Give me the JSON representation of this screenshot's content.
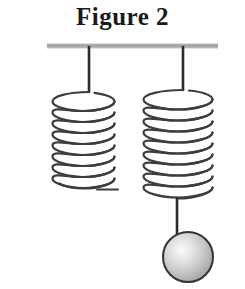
{
  "figure": {
    "title": "Figure 2",
    "caption_position": "top-center",
    "background_color": "#ffffff",
    "width": 245,
    "height": 289
  },
  "ceiling": {
    "name": "support-bar",
    "label": "ceiling support bar",
    "color": "#a8a8a8",
    "x1": 47,
    "x2": 218,
    "y": 46,
    "thickness": 5
  },
  "springs": [
    {
      "id": "left",
      "name": "spring-left",
      "label": "Left spring (no mass attached)",
      "hanger_x": 89,
      "hanger_top": 48,
      "hanger_bottom": 92,
      "coil_left": 52,
      "coil_right": 115,
      "coil_top": 88,
      "coil_bottom": 190,
      "turns": 9,
      "wire_color": "#3d3d3d",
      "wire_width": 2.2,
      "has_mass": false,
      "free_end": true
    },
    {
      "id": "right",
      "name": "spring-right",
      "label": "Right spring (mass attached)",
      "hanger_x": 183,
      "hanger_top": 48,
      "hanger_bottom": 90,
      "coil_left": 143,
      "coil_right": 213,
      "coil_top": 86,
      "coil_bottom": 200,
      "turns": 10,
      "wire_color": "#3d3d3d",
      "wire_width": 2.2,
      "has_mass": true,
      "free_end": false
    }
  ],
  "mass": {
    "name": "hanging-ball",
    "label": "spherical mass",
    "center_x": 188,
    "center_y": 257,
    "radius": 25,
    "fill_light": "#f2f2f2",
    "fill_mid": "#c9c9c9",
    "fill_dark": "#9a9a9a",
    "outline_color": "#333333",
    "outline_width": 2,
    "connector": {
      "name": "mass-connector",
      "from_x": 177,
      "from_y": 200,
      "to_x": 177,
      "to_y": 234,
      "color": "#2b2b2b",
      "width": 2.4
    }
  }
}
